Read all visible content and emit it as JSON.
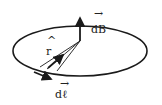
{
  "diagram": {
    "labels": {
      "dB": "dB",
      "r_hat": "r",
      "dl": "dℓ"
    },
    "decorations": {
      "vector_arrow": "→",
      "unit_hat": "^"
    },
    "colors": {
      "stroke": "#1a1a1a",
      "background": "#ffffff"
    }
  }
}
